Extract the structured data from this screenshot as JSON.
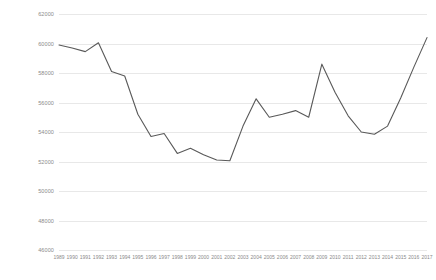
{
  "chart_data": {
    "type": "line",
    "title": "",
    "subtitle": "",
    "xlabel": "",
    "ylabel": "",
    "grid": true,
    "legend": false,
    "legend_position": "none",
    "line_color": "#595959",
    "gridline_color": "#E8E8E8",
    "tick_label_color": "#8A8A8A",
    "background": "#FFFFFF",
    "ylim": [
      46000,
      62000
    ],
    "yticks": [
      46000,
      48000,
      50000,
      52000,
      54000,
      56000,
      58000,
      60000,
      62000
    ],
    "ytick_labels": [
      "46000",
      "48000",
      "50000",
      "52000",
      "54000",
      "56000",
      "58000",
      "60000",
      "62000"
    ],
    "categories": [
      "1989",
      "1990",
      "1991",
      "1992",
      "1993",
      "1994",
      "1995",
      "1996",
      "1997",
      "1998",
      "1999",
      "2000",
      "2001",
      "2002",
      "2003",
      "2004",
      "2005",
      "2006",
      "2007",
      "2008",
      "2009",
      "2010",
      "2011",
      "2012",
      "2013",
      "2014",
      "2015",
      "2016",
      "2017"
    ],
    "values": [
      59900,
      59700,
      59450,
      60050,
      58100,
      57800,
      55200,
      53700,
      53900,
      52550,
      52900,
      52450,
      52100,
      52050,
      54400,
      56250,
      55000,
      55200,
      55450,
      55000,
      58600,
      56700,
      55100,
      54000,
      53850,
      54400,
      56300,
      58400,
      60400
    ],
    "series": [
      {
        "name": "series-1",
        "values": [
          59900,
          59700,
          59450,
          60050,
          58100,
          57800,
          55200,
          53700,
          53900,
          52550,
          52900,
          52450,
          52100,
          52050,
          54400,
          56250,
          55000,
          55200,
          55450,
          55000,
          58600,
          56700,
          55100,
          54000,
          53850,
          54400,
          56300,
          58400,
          60400
        ]
      }
    ]
  }
}
